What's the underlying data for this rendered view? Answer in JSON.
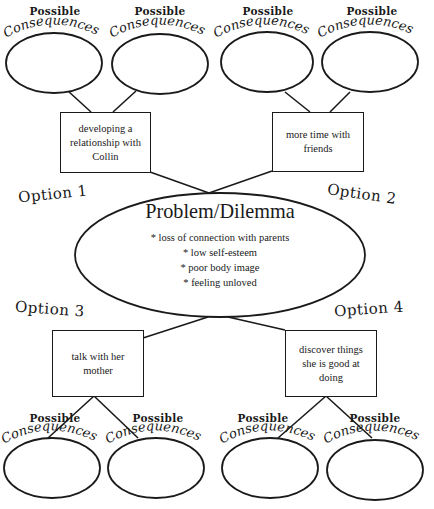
{
  "diagram": {
    "type": "decision-making graphic organizer",
    "problem": {
      "title": "Problem/Dilemma",
      "items": [
        "* loss of connection with parents",
        "* low self-esteem",
        "* poor body image",
        "* feeling unloved"
      ]
    },
    "options": [
      {
        "label": "Option 1",
        "text": "developing a relationship with Collin"
      },
      {
        "label": "Option 2",
        "text": "more time with friends"
      },
      {
        "label": "Option 3",
        "text": "talk with her mother"
      },
      {
        "label": "Option 4",
        "text": "discover things she is good at doing"
      }
    ],
    "consequences": {
      "label_top": "Possible",
      "label_arc": "Consequences",
      "count_per_option": 2,
      "values": [
        "",
        "",
        "",
        "",
        "",
        "",
        "",
        ""
      ]
    },
    "colors": {
      "stroke": "#1a1a1a",
      "background": "#ffffff"
    }
  }
}
